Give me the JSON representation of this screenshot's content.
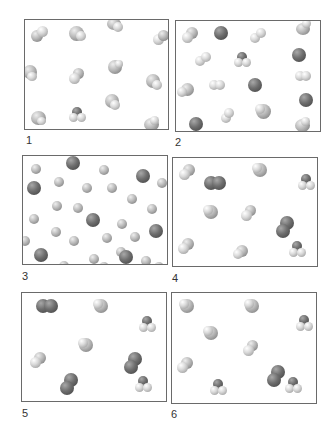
{
  "figure": {
    "panels": [
      {
        "id": "1",
        "label": "1",
        "description": "Identical triatomic/tetrahedral molecules (single compound)"
      },
      {
        "id": "2",
        "label": "2",
        "description": "Mixture of single atoms, diatomic molecules and compound molecules"
      },
      {
        "id": "3",
        "label": "3",
        "description": "Mixture of small light atoms and larger dark atoms"
      },
      {
        "id": "4",
        "label": "4",
        "description": "Mixture of diatomic dark molecules and several compound molecules"
      },
      {
        "id": "5",
        "label": "5",
        "description": "Mixture of dark diatomic molecules and compound molecules"
      },
      {
        "id": "6",
        "label": "6",
        "description": "Compound molecules with one dark diatomic molecule"
      }
    ]
  }
}
